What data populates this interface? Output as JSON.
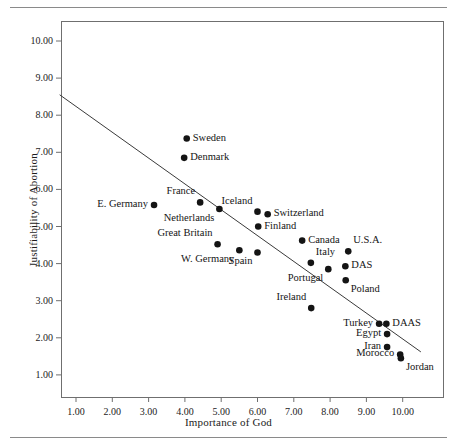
{
  "figure": {
    "has_top_rule": true,
    "has_bottom_rule": true,
    "frame_color": "#6f6f6f",
    "ink_color": "#141414"
  },
  "chart_data": {
    "type": "scatter",
    "title": "",
    "xlabel": "Importance of God",
    "ylabel": "Justifiability of Abortion",
    "xlim": [
      0.5,
      10.5
    ],
    "ylim": [
      0.5,
      10.6
    ],
    "grid": false,
    "legend": "none",
    "xticks": [
      "1.00",
      "2.00",
      "3.00",
      "4.00",
      "5.00",
      "6.00",
      "7.00",
      "8.00",
      "9.00",
      "10.00"
    ],
    "xtick_values": [
      1,
      2,
      3,
      4,
      5,
      6,
      7,
      8,
      9,
      10
    ],
    "yticks": [
      "1.00",
      "2.00",
      "3.00",
      "4.00",
      "5.00",
      "6.00",
      "7.00",
      "8.00",
      "9.00",
      "10.00"
    ],
    "ytick_values": [
      1,
      2,
      3,
      4,
      5,
      6,
      7,
      8,
      9,
      10
    ],
    "points": [
      {
        "label": "E. Germany",
        "x": 3.15,
        "y": 5.58,
        "label_pos": "left"
      },
      {
        "label": "Sweden",
        "x": 4.05,
        "y": 7.37,
        "label_pos": "right"
      },
      {
        "label": "Denmark",
        "x": 3.98,
        "y": 6.85,
        "label_pos": "right"
      },
      {
        "label": "France",
        "x": 4.42,
        "y": 5.65,
        "label_pos": "upleft"
      },
      {
        "label": "Netherlands",
        "x": 4.95,
        "y": 5.47,
        "label_pos": "downleft"
      },
      {
        "label": "Iceland",
        "x": 6.0,
        "y": 5.4,
        "label_pos": "upleft"
      },
      {
        "label": "Switzerland",
        "x": 6.28,
        "y": 5.33,
        "label_pos": "right"
      },
      {
        "label": "Finland",
        "x": 6.02,
        "y": 5.0,
        "label_pos": "right"
      },
      {
        "label": "Great Britain",
        "x": 4.9,
        "y": 4.52,
        "label_pos": "upleft"
      },
      {
        "label": "W. Germany",
        "x": 5.5,
        "y": 4.36,
        "label_pos": "downleft"
      },
      {
        "label": "Spain",
        "x": 6.0,
        "y": 4.3,
        "label_pos": "downleft"
      },
      {
        "label": "Canada",
        "x": 7.23,
        "y": 4.62,
        "label_pos": "right"
      },
      {
        "label": "U.S.A.",
        "x": 8.5,
        "y": 4.33,
        "label_pos": "upright"
      },
      {
        "label": "Italy",
        "x": 7.47,
        "y": 4.02,
        "label_pos": "upright"
      },
      {
        "label": "DAS",
        "x": 8.42,
        "y": 3.93,
        "label_pos": "right"
      },
      {
        "label": "Portugal",
        "x": 7.95,
        "y": 3.85,
        "label_pos": "downleft"
      },
      {
        "label": "Poland",
        "x": 8.43,
        "y": 3.55,
        "label_pos": "downright"
      },
      {
        "label": "Ireland",
        "x": 7.48,
        "y": 2.8,
        "label_pos": "upleft"
      },
      {
        "label": "Turkey",
        "x": 9.35,
        "y": 2.38,
        "label_pos": "left"
      },
      {
        "label": "DAAS",
        "x": 9.55,
        "y": 2.38,
        "label_pos": "right"
      },
      {
        "label": "Egypt",
        "x": 9.57,
        "y": 2.1,
        "label_pos": "left"
      },
      {
        "label": "Iran",
        "x": 9.57,
        "y": 1.75,
        "label_pos": "left"
      },
      {
        "label": "Morocco",
        "x": 9.93,
        "y": 1.55,
        "label_pos": "left"
      },
      {
        "label": "Jordan",
        "x": 9.95,
        "y": 1.45,
        "label_pos": "downright"
      }
    ],
    "trend_line": {
      "name": "regression-line",
      "x_start": 0.55,
      "y_start": 8.55,
      "x_end": 10.5,
      "y_end": 1.62
    }
  }
}
